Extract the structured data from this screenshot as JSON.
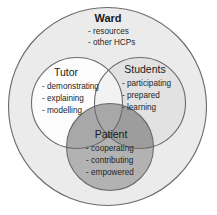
{
  "diagram": {
    "type": "venn-nested",
    "canvas": {
      "width": 217,
      "height": 215
    },
    "background_color": "#ffffff",
    "outline_color": "#6b6b6b"
  },
  "ward": {
    "label": "Ward",
    "fill_color": "#ebebeb",
    "items": [
      "- resources",
      "- other HCPs"
    ]
  },
  "tutor": {
    "label": "Tutor",
    "fill_color": "#ffffff",
    "items": [
      "- demonstrating",
      "- explaining",
      "- modelling"
    ]
  },
  "students": {
    "label": "Students",
    "fill_color": "#e2e2e2",
    "items": [
      "- participating",
      "- prepared",
      "- learning"
    ]
  },
  "patient": {
    "label": "Patient",
    "fill_color": "#b2b2b2",
    "items": [
      "- cooperating",
      "- contributing",
      "- empowered"
    ]
  }
}
